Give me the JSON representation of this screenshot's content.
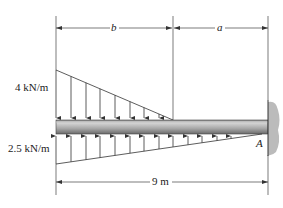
{
  "diagram": {
    "type": "cantilever beam with distributed loads",
    "labels": {
      "top_load": "4 kN/m",
      "bottom_load": "2.5 kN/m",
      "dim_b": "b",
      "dim_a": "a",
      "total_length": "9 m",
      "support": "A"
    },
    "loads": [
      {
        "name": "downward triangular load",
        "max_intensity": "4 kN/m",
        "direction": "down",
        "span": "b",
        "arrows": 8
      },
      {
        "name": "upward triangular load",
        "max_intensity": "2.5 kN/m",
        "direction": "up",
        "span": "9 m",
        "arrows": 14
      }
    ],
    "support": {
      "type": "fixed wall",
      "point": "A",
      "side": "right"
    },
    "colors": {
      "line": "#333333",
      "beam_top": "#9a9a9a",
      "beam_mid": "#c8c8c8",
      "wall": "#b0b0b0"
    }
  }
}
